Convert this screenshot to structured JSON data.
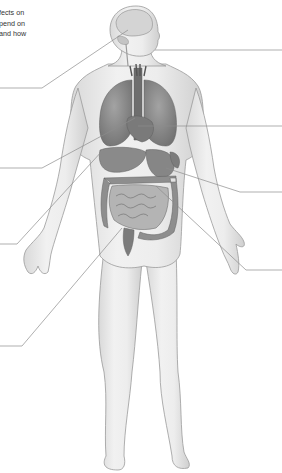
{
  "diagram": {
    "type": "anatomical-labeling-diagram",
    "caption_fragments": [
      "fects on",
      "pend on",
      "and how"
    ],
    "colors": {
      "background": "#ffffff",
      "body_fill": "#ececec",
      "body_outline": "#9a9a9a",
      "organ_fill": "#8a8a8a",
      "organ_dark": "#6e6e6e",
      "leader_line": "#8c8c8c",
      "caption_text": "#333333"
    },
    "leader_lines": [
      {
        "id": "left-1",
        "side": "left",
        "target": "brain",
        "points": [
          [
            0,
            88
          ],
          [
            42,
            88
          ],
          [
            128,
            30
          ]
        ]
      },
      {
        "id": "left-2",
        "side": "left",
        "target": "heart",
        "points": [
          [
            0,
            168
          ],
          [
            42,
            168
          ],
          [
            135,
            118
          ]
        ]
      },
      {
        "id": "left-3",
        "side": "left",
        "target": "liver",
        "points": [
          [
            0,
            244
          ],
          [
            17,
            244
          ],
          [
            103,
            150
          ]
        ]
      },
      {
        "id": "left-4",
        "side": "left",
        "target": "small-intestine",
        "points": [
          [
            0,
            346
          ],
          [
            22,
            346
          ],
          [
            122,
            228
          ]
        ]
      },
      {
        "id": "right-1",
        "side": "right",
        "target": "head",
        "points": [
          [
            155,
            50
          ],
          [
            282,
            50
          ]
        ]
      },
      {
        "id": "right-2",
        "side": "right",
        "target": "aorta",
        "points": [
          [
            138,
            126
          ],
          [
            282,
            126
          ]
        ]
      },
      {
        "id": "right-3",
        "side": "right",
        "target": "stomach",
        "points": [
          [
            166,
            168
          ],
          [
            240,
            192
          ],
          [
            282,
            192
          ]
        ]
      },
      {
        "id": "right-4",
        "side": "right",
        "target": "spleen",
        "points": [
          [
            156,
            186
          ],
          [
            246,
            270
          ],
          [
            282,
            270
          ]
        ]
      }
    ],
    "label_blanks": 8
  }
}
